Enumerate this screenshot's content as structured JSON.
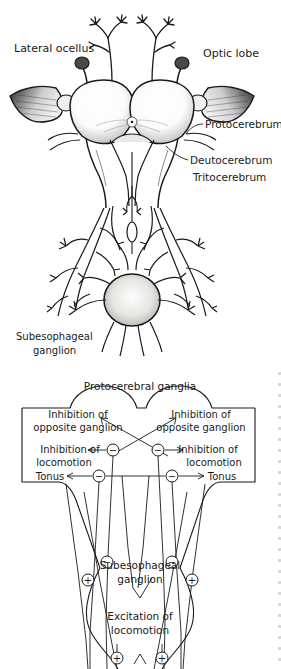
{
  "figure": {
    "background_color": "#ffffff",
    "ink_color": "#1a1a1a",
    "shade_color": "#8a8a8a",
    "panels": [
      {
        "id": "panel-a",
        "kind": "anatomical-drawing",
        "subject": "insect brain dorsal view"
      },
      {
        "id": "panel-b",
        "kind": "schematic-diagram",
        "subject": "neural control of locomotion"
      }
    ]
  },
  "anatomy": {
    "labels": {
      "lateral_ocellus": "Lateral ocellus",
      "optic_lobe": "Optic lobe",
      "protocerebrum": "Protocerebrum",
      "deutocerebrum": "Deutocerebrum",
      "tritocerebrum": "Tritocerebrum",
      "subesophageal_ganglion_line1": "Subesophageal",
      "subesophageal_ganglion_line2": "ganglion"
    }
  },
  "schematic": {
    "title": "Protocerebral  ganglia",
    "left": {
      "inhibition_opposite_line1": "Inhibition of",
      "inhibition_opposite_line2": "opposite ganglion",
      "inhibition_locomotion_line1": "Inhibition of",
      "inhibition_locomotion_line2": "locomotion",
      "tonus": "Tonus"
    },
    "right": {
      "inhibition_opposite_line1": "Inhibition of",
      "inhibition_opposite_line2": "opposite ganglion",
      "inhibition_locomotion_line1": "Inhibition of",
      "inhibition_locomotion_line2": "locomotion",
      "tonus": "Tonus"
    },
    "lower": {
      "subesophageal_line1": "Subesophageal",
      "subesophageal_line2": "ganglion",
      "excitation_line1": "Excitation of",
      "excitation_line2": "locomotion"
    },
    "signs": {
      "minus": "−",
      "plus": "+"
    },
    "sign_nodes": [
      {
        "id": "node-minus-upper-left",
        "sign": "−",
        "x": 113,
        "y": 450
      },
      {
        "id": "node-minus-upper-right",
        "sign": "−",
        "x": 158,
        "y": 450
      },
      {
        "id": "node-minus-lower-left",
        "sign": "−",
        "x": 99,
        "y": 476
      },
      {
        "id": "node-minus-lower-right",
        "sign": "−",
        "x": 172,
        "y": 476
      },
      {
        "id": "node-minus-mid-left",
        "sign": "−",
        "x": 107,
        "y": 562
      },
      {
        "id": "node-minus-mid-right",
        "sign": "−",
        "x": 172,
        "y": 562
      },
      {
        "id": "node-plus-outer-left",
        "sign": "+",
        "x": 88,
        "y": 580
      },
      {
        "id": "node-plus-outer-right",
        "sign": "+",
        "x": 192,
        "y": 580
      },
      {
        "id": "node-plus-bottom-left",
        "sign": "+",
        "x": 117,
        "y": 658
      },
      {
        "id": "node-plus-bottom-right",
        "sign": "+",
        "x": 162,
        "y": 658
      }
    ]
  }
}
